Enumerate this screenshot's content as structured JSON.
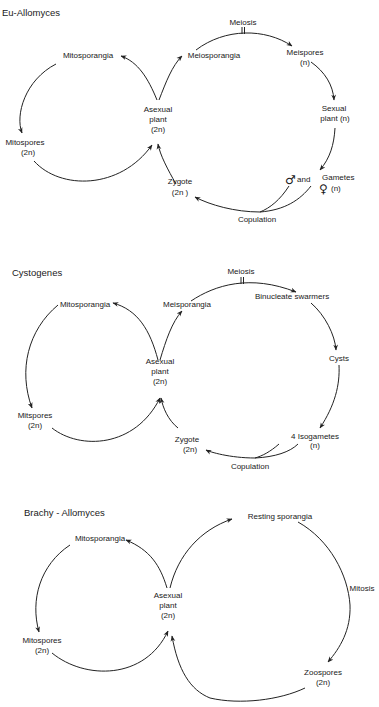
{
  "diagrams": [
    {
      "title": "Eu-Allomyces",
      "labels": {
        "mitosporangia": "Mitosporangia",
        "meiosporangia": "Meiosporangia",
        "meiosis": "Meiosis",
        "meispores": "Meispores",
        "meispores_ploidy": "(n)",
        "sexual_plant_1": "Sexual",
        "sexual_plant_2": "plant  (n)",
        "asexual_1": "Asexual",
        "asexual_2": "plant",
        "asexual_3": "(2n)",
        "mitospores": "Mitospores",
        "mitospores_ploidy": "(2n)",
        "zygote": "Zygote",
        "zygote_ploidy": "(2n )",
        "male_symbol": "♂",
        "and": "and",
        "gametes": "Gametes",
        "female_symbol": "♀",
        "gametes_ploidy": "(n)",
        "copulation": "Copulation"
      }
    },
    {
      "title": "Cystogenes",
      "labels": {
        "mitosporangia": "Mitosporangia",
        "meisporangia": "Meisporangia",
        "meiosis": "Meiosis",
        "binucleate": "Binucleate swarmers",
        "cysts": "Cysts",
        "isogametes": "4  Isogametes",
        "isogametes_ploidy": "(n)",
        "asexual_1": "Asexual",
        "asexual_2": "plant",
        "asexual_3": "(2n)",
        "mitspores": "Mitspores",
        "mitspores_ploidy": "(2n)",
        "zygote": "Zygote",
        "zygote_ploidy": "(2n)",
        "copulation": "Copulation"
      }
    },
    {
      "title": "Brachy - Allomyces",
      "labels": {
        "mitosporangia": "Mitosporangia",
        "resting_sporangia": "Resting sporangia",
        "mitosis": "Mitosis",
        "zoospores": "Zoospores",
        "zoospores_ploidy": "(2n)",
        "asexual_1": "Asexual",
        "asexual_2": "plant",
        "asexual_3": "(2n)",
        "mitospores": "Mitospores",
        "mitospores_ploidy": "(2n)"
      }
    }
  ]
}
